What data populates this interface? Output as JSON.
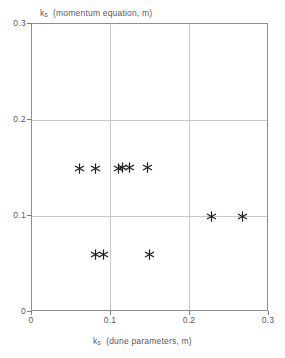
{
  "chart_data": {
    "type": "scatter",
    "title": "",
    "xlabel": "k_s  (dune parameters, m)",
    "ylabel": "k_s  (momentum equation, m)",
    "xlabel_symbol": "k",
    "xlabel_subscript": "s",
    "xlabel_rest": "(dune parameters, m)",
    "ylabel_symbol": "k",
    "ylabel_subscript": "s",
    "ylabel_rest": "(momentum equation, m)",
    "xlim": [
      0,
      0.3
    ],
    "ylim": [
      0,
      0.3
    ],
    "xticks": [
      0,
      0.1,
      0.2,
      0.3
    ],
    "yticks": [
      0,
      0.1,
      0.2,
      0.3
    ],
    "xticklabels": [
      "0",
      "0.1",
      "0.2",
      "0.3"
    ],
    "yticklabels": [
      "0",
      "0.1",
      "0.2",
      "0.3"
    ],
    "grid": true,
    "gridlines_x": [
      0.1,
      0.2
    ],
    "gridlines_y": [
      0.1,
      0.2
    ],
    "legend": null,
    "marker": "asterisk",
    "marker_color": "#222222",
    "frame_color": "#8e8e8e",
    "grid_color": "#c9c9c9",
    "points": [
      {
        "x": 0.06,
        "y": 0.15
      },
      {
        "x": 0.081,
        "y": 0.15
      },
      {
        "x": 0.109,
        "y": 0.15
      },
      {
        "x": 0.115,
        "y": 0.151
      },
      {
        "x": 0.124,
        "y": 0.151
      },
      {
        "x": 0.146,
        "y": 0.151
      },
      {
        "x": 0.08,
        "y": 0.06
      },
      {
        "x": 0.091,
        "y": 0.06
      },
      {
        "x": 0.149,
        "y": 0.06
      },
      {
        "x": 0.227,
        "y": 0.1
      },
      {
        "x": 0.267,
        "y": 0.1
      }
    ]
  }
}
